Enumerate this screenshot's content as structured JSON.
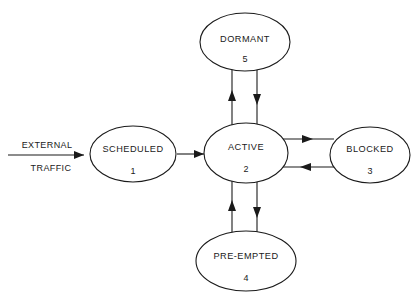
{
  "diagram": {
    "background_color": "#ffffff",
    "stroke_color": "#1a1a1a",
    "nodes": [
      {
        "id": "scheduled",
        "label": "SCHEDULED",
        "number": "1",
        "cx": 133,
        "cy": 154,
        "rx": 43,
        "ry": 28
      },
      {
        "id": "active",
        "label": "ACTIVE",
        "number": "2",
        "cx": 246,
        "cy": 153,
        "rx": 42,
        "ry": 30
      },
      {
        "id": "blocked",
        "label": "BLOCKED",
        "number": "3",
        "cx": 370,
        "cy": 155,
        "rx": 40,
        "ry": 28
      },
      {
        "id": "preempted",
        "label": "PRE-EMPTED",
        "number": "4",
        "cx": 246,
        "cy": 261,
        "rx": 50,
        "ry": 30
      },
      {
        "id": "dormant",
        "label": "DORMANT",
        "number": "5",
        "cx": 245,
        "cy": 42,
        "rx": 45,
        "ry": 29
      }
    ],
    "edges": [
      {
        "id": "external-traffic-in",
        "from": "external",
        "to": "scheduled",
        "direction": "right"
      },
      {
        "id": "scheduled-to-active",
        "from": "scheduled",
        "to": "active",
        "direction": "right"
      },
      {
        "id": "active-to-dormant",
        "from": "active",
        "to": "dormant",
        "direction": "up"
      },
      {
        "id": "dormant-to-active",
        "from": "dormant",
        "to": "active",
        "direction": "down"
      },
      {
        "id": "active-to-blocked",
        "from": "active",
        "to": "blocked",
        "direction": "right"
      },
      {
        "id": "blocked-to-active",
        "from": "blocked",
        "to": "active",
        "direction": "left"
      },
      {
        "id": "preempted-to-active",
        "from": "preempted",
        "to": "active",
        "direction": "up"
      },
      {
        "id": "active-to-preempted",
        "from": "active",
        "to": "preempted",
        "direction": "down"
      }
    ],
    "external_label": {
      "line1": "EXTERNAL",
      "line2": "TRAFFIC"
    }
  }
}
